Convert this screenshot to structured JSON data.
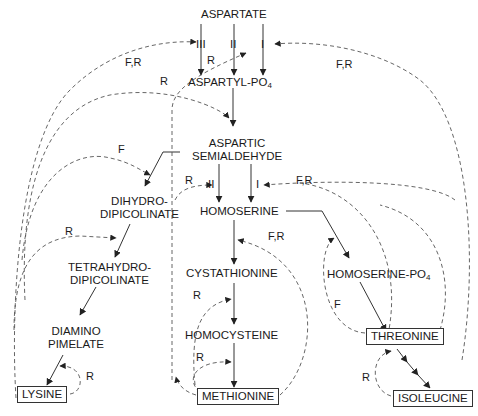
{
  "diagram": {
    "nodes": {
      "aspartate": "ASPARTATE",
      "aspartyl_po4": "ASPARTYL-PO",
      "aspartyl_po4_sub": "4",
      "aspartic_semialdehyde_1": "ASPARTIC",
      "aspartic_semialdehyde_2": "SEMIALDEHYDE",
      "dihydrodipicolinate_1": "DIHYDRO-",
      "dihydrodipicolinate_2": "DIPICOLINATE",
      "tetrahydrodipicolinate_1": "TETRAHYDRO-",
      "tetrahydrodipicolinate_2": "DIPICOLINATE",
      "diaminopimelate_1": "DIAMINO",
      "diaminopimelate_2": "PIMELATE",
      "lysine": "LYSINE",
      "homoserine": "HOMOSERINE",
      "cystathionine": "CYSTATHIONINE",
      "homocysteine": "HOMOCYSTEINE",
      "methionine": "METHIONINE",
      "homoserine_po4": "HOMOSERINE-PO",
      "homoserine_po4_sub": "4",
      "threonine": "THREONINE",
      "isoleucine": "ISOLEUCINE"
    },
    "enzyme_labels": {
      "ak_III": "III",
      "ak_II": "II",
      "ak_I": "I",
      "hd_II": "II",
      "hd_I": "I"
    },
    "regulation_labels": {
      "fr_lysine_akIII": "F,R",
      "fr_threonine_akI": "F,R",
      "r_akII": "R",
      "r_methionine_aspartyl": "R",
      "f_lysine_dhdp": "F",
      "r_hdII": "R",
      "fr_threonine_hdI": "F,R",
      "r_tetrahydro": "R",
      "fr_cystathionine": "F,R",
      "r_homocysteine": "R",
      "r_methionine_self": "R",
      "r_lysine_self": "R",
      "f_threonine_hsp": "F",
      "r_isoleucine": "R"
    },
    "legend": {
      "F": "Feedback inhibition",
      "R": "Repression"
    }
  }
}
